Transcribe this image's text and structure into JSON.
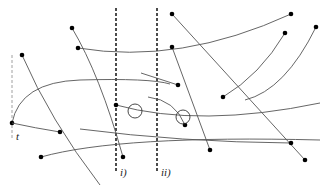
{
  "diagram": {
    "labels": {
      "t": "t",
      "line_i": "i)",
      "line_ii": "ii)"
    },
    "colors": {
      "stroke": "#555555",
      "dash": "#111111",
      "dot": "#000000"
    },
    "vertical_lines": [
      {
        "name": "i",
        "x": 116,
        "y1": 8,
        "y2": 172
      },
      {
        "name": "ii",
        "x": 157,
        "y1": 8,
        "y2": 172
      }
    ],
    "time_axis": {
      "x": 12,
      "y1": 55,
      "y2": 140
    },
    "circles": [
      {
        "cx": 135,
        "cy": 111,
        "r": 7
      },
      {
        "cx": 183,
        "cy": 117,
        "r": 7
      }
    ],
    "curves": [
      {
        "d": "M72,28 Q100,75 123,157",
        "dots": [
          [
            72,
            28
          ],
          [
            123,
            157
          ]
        ]
      },
      {
        "d": "M78,48 Q180,65 291,14",
        "dots": [
          [
            78,
            48
          ],
          [
            291,
            14
          ]
        ]
      },
      {
        "d": "M22,55 Q50,120 100,185",
        "dots": [
          [
            22,
            55
          ]
        ]
      },
      {
        "d": "M12,123 Q20,82 80,80 Q150,78 170,84",
        "dots": [
          [
            12,
            123
          ]
        ]
      },
      {
        "d": "M12,123 Q35,128 60,132",
        "dots": [
          [
            60,
            132
          ]
        ]
      },
      {
        "d": "M141,73 L178,85",
        "dots": [
          [
            178,
            85
          ]
        ]
      },
      {
        "d": "M116,105 Q200,128 320,103",
        "dots": [
          [
            116,
            105
          ]
        ]
      },
      {
        "d": "M172,14 L305,160",
        "dots": [
          [
            172,
            14
          ],
          [
            305,
            160
          ]
        ]
      },
      {
        "d": "M172,47 L210,150",
        "dots": [
          [
            172,
            47
          ],
          [
            210,
            150
          ]
        ]
      },
      {
        "d": "M148,97 Q175,100 185,125",
        "dots": [
          [
            185,
            125
          ]
        ]
      },
      {
        "d": "M285,33 Q260,75 223,97",
        "dots": [
          [
            285,
            33
          ],
          [
            223,
            97
          ]
        ]
      },
      {
        "d": "M316,27 Q285,90 245,100",
        "dots": [
          [
            316,
            27
          ]
        ]
      },
      {
        "d": "M41,157 Q120,135 320,140",
        "dots": [
          [
            41,
            157
          ]
        ]
      },
      {
        "d": "M80,129 Q180,142 291,143",
        "dots": [
          [
            291,
            143
          ]
        ]
      }
    ]
  }
}
